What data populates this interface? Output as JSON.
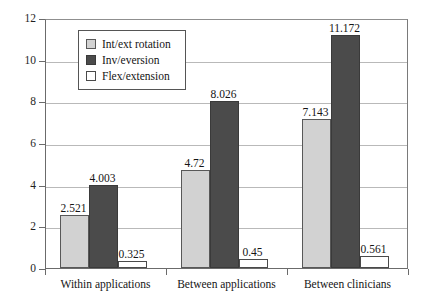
{
  "chart_data": {
    "type": "bar",
    "title": "",
    "subtitle": "",
    "xlabel": "",
    "ylabel": "",
    "categories": [
      "Within applications",
      "Between applications",
      "Between clinicians"
    ],
    "series": [
      {
        "name": "Int/ext rotation",
        "color": "#d2d2d2",
        "values": [
          2.521,
          4.72,
          7.143
        ],
        "labels": [
          "2.521",
          "4.72",
          "7.143"
        ]
      },
      {
        "name": "Inv/eversion",
        "color": "#4b4b4b",
        "values": [
          4.003,
          8.026,
          11.172
        ],
        "labels": [
          "4.003",
          "8.026",
          "11.172"
        ]
      },
      {
        "name": "Flex/extension",
        "color": "#ffffff",
        "values": [
          0.325,
          0.45,
          0.561
        ],
        "labels": [
          "0.325",
          "0.45",
          "0.561"
        ]
      }
    ],
    "ylim": [
      0,
      12
    ],
    "yticks": [
      0,
      2,
      4,
      6,
      8,
      10,
      12
    ],
    "ytick_labels": [
      "0",
      "2",
      "4",
      "6",
      "8",
      "10",
      "12"
    ],
    "grid": true,
    "grid_axis": "y",
    "legend_position": "upper-left-inside",
    "bar_labels_shown": true
  }
}
